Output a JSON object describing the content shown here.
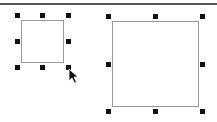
{
  "canvas": {
    "background": "#ffffff",
    "divider_color": "#555555",
    "shapes": [
      {
        "name": "small-square",
        "selected": true,
        "border_color": "#999999"
      },
      {
        "name": "large-square",
        "selected": true,
        "border_color": "#999999"
      }
    ],
    "handle_color": "#111111",
    "cursor": "arrow-pointer"
  }
}
